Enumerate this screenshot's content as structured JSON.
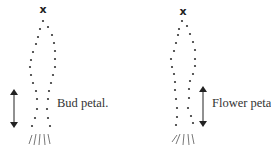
{
  "figures": [
    {
      "id": "bud",
      "label": "Bud petal.",
      "apex_marker": "x",
      "color": "#222222"
    },
    {
      "id": "flower",
      "label": "Flower petal.",
      "apex_marker": "x",
      "color": "#222222"
    }
  ],
  "icons": {
    "apex": "x-mark-icon",
    "measure": "double-arrow-icon",
    "stem": "stem-lines-icon"
  }
}
